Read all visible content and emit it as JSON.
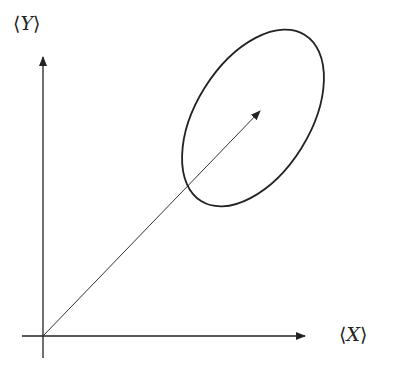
{
  "diagram": {
    "y_axis_label": {
      "open": "⟨",
      "var": "Y",
      "close": "⟩"
    },
    "x_axis_label": {
      "open": "⟨",
      "var": "X",
      "close": "⟩"
    },
    "colors": {
      "stroke": "#222222",
      "background": "#ffffff"
    }
  }
}
